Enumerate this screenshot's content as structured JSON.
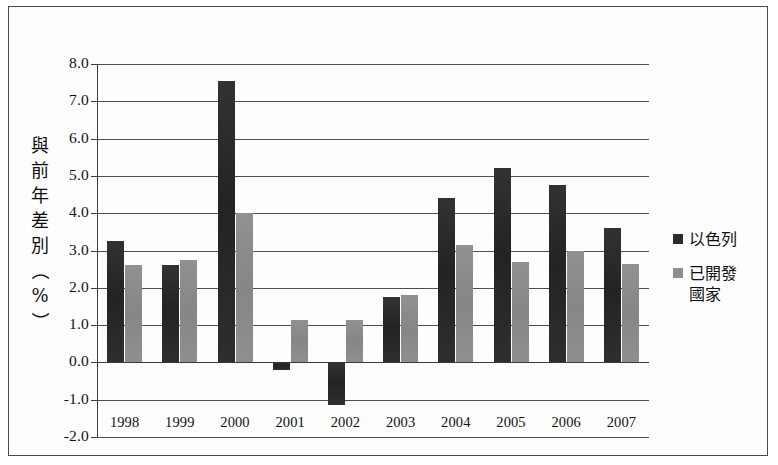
{
  "chart_data": {
    "type": "bar",
    "title": "",
    "xlabel": "",
    "ylabel": "與前年差別（%）",
    "categories": [
      "1998",
      "1999",
      "2000",
      "2001",
      "2002",
      "2003",
      "2004",
      "2005",
      "2006",
      "2007"
    ],
    "series": [
      {
        "name": "以色列",
        "color": "#2b2b2b",
        "values": [
          3.25,
          2.6,
          7.55,
          -0.2,
          -1.15,
          1.75,
          4.4,
          5.2,
          4.75,
          3.6
        ]
      },
      {
        "name": "已開發國家",
        "color": "#8d8d8d",
        "values": [
          2.6,
          2.75,
          4.0,
          1.15,
          1.15,
          1.8,
          3.15,
          2.7,
          3.0,
          2.65
        ]
      }
    ],
    "ylim": [
      -2.0,
      8.0
    ],
    "ytick_step": 1.0,
    "ytick_labels": [
      "8.0",
      "7.0",
      "6.0",
      "5.0",
      "4.0",
      "3.0",
      "2.0",
      "1.0",
      "0.0",
      "-1.0",
      "-2.0"
    ],
    "ytick_values": [
      8.0,
      7.0,
      6.0,
      5.0,
      4.0,
      3.0,
      2.0,
      1.0,
      0.0,
      -1.0,
      -2.0
    ],
    "grid": true,
    "legend_position": "right",
    "zero_line": 0.0
  },
  "axis": {
    "y_title_chars": [
      "與",
      "前",
      "年",
      "差",
      "別",
      "（",
      "%",
      "）"
    ]
  },
  "legend": {
    "items": [
      {
        "label": "以色列",
        "color": "#2b2b2b"
      },
      {
        "label": "已開發\n國家",
        "color": "#8d8d8d"
      }
    ]
  }
}
